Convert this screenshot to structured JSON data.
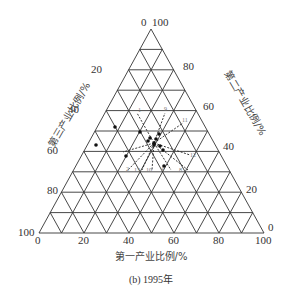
{
  "caption": "(b) 1995年",
  "axes": {
    "bottom": {
      "title": "第一产业比例/%",
      "ticks": [
        "0",
        "20",
        "40",
        "60",
        "80",
        "100"
      ]
    },
    "left": {
      "title": "第三产业比例/%",
      "ticks": [
        "100",
        "80",
        "60",
        "40",
        "20"
      ]
    },
    "right": {
      "title": "第二产业比例/%",
      "ticks": [
        "0",
        "20",
        "40",
        "60",
        "80",
        "100"
      ]
    },
    "apex_label_left": "0",
    "apex_label_right": "100",
    "left_base_label": "100",
    "bottom_zero": "0",
    "right_base_top": "0",
    "right_base_bottom": "100"
  },
  "point_labels": [
    "1",
    "2",
    "3",
    "4",
    "5",
    "6",
    "7",
    "8",
    "9",
    "10",
    "11",
    "12",
    "13"
  ],
  "chart_data": {
    "type": "scatter",
    "subtype": "ternary",
    "title": "(b) 1995年",
    "axes": [
      "第一产业比例/%",
      "第二产业比例/%",
      "第三产业比例/%"
    ],
    "grid_step": 10,
    "points_px": [
      [
        115,
        127
      ],
      [
        96,
        145
      ],
      [
        140,
        132
      ],
      [
        148,
        141
      ],
      [
        150,
        138
      ],
      [
        156,
        139
      ],
      [
        159,
        134
      ],
      [
        160,
        146
      ],
      [
        154,
        143
      ],
      [
        163,
        150
      ],
      [
        126,
        156
      ],
      [
        164,
        166
      ],
      [
        154,
        145
      ]
    ]
  }
}
